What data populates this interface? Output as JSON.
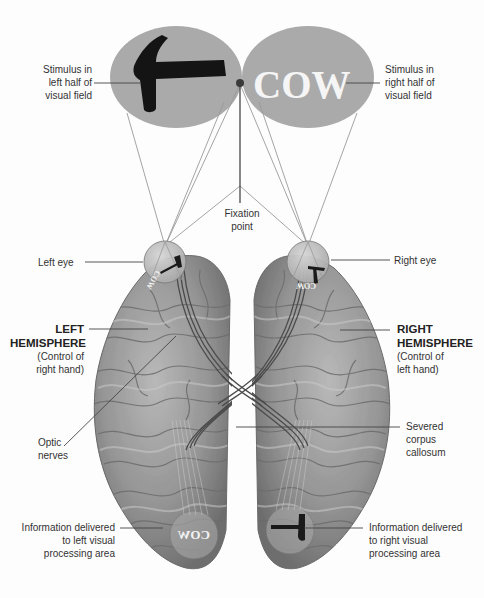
{
  "diagram": {
    "colors": {
      "field_oval": "#aaaaaa",
      "hammer": "#141414",
      "cow_text": "#f5f5f5",
      "fixation_dot": "#3a3a3a",
      "brain_base": "#8f8f8f",
      "brain_highlight": "#c4c4c4",
      "nerve": "#4a4a4a",
      "eye_fill": "#bdbdbd",
      "leader_line": "#444444",
      "sight_line": "#9a9a9a"
    },
    "stimuli": {
      "left_field_object": "hammer",
      "right_field_word": "COW",
      "left_eye_word_mirrored": "COW",
      "left_visual_area_word": "COW",
      "right_visual_area_object": "hammer"
    },
    "labels": {
      "stimulus_left": [
        "Stimulus in",
        "left half of",
        "visual field"
      ],
      "stimulus_right": [
        "Stimulus in",
        "right half of",
        "visual field"
      ],
      "fixation_point": [
        "Fixation",
        "point"
      ],
      "left_eye": "Left eye",
      "right_eye": "Right eye",
      "left_hemisphere_title": [
        "LEFT",
        "HEMISPHERE"
      ],
      "left_hemisphere_sub": [
        "(Control of",
        "right hand)"
      ],
      "right_hemisphere_title": [
        "RIGHT",
        "HEMISPHERE"
      ],
      "right_hemisphere_sub": [
        "(Control of",
        "left hand)"
      ],
      "optic_nerves": [
        "Optic",
        "nerves"
      ],
      "corpus_callosum": [
        "Severed",
        "corpus",
        "callosum"
      ],
      "left_info": [
        "Information delivered",
        "to left visual",
        "processing area"
      ],
      "right_info": [
        "Information delivered",
        "to right visual",
        "processing area"
      ]
    }
  }
}
